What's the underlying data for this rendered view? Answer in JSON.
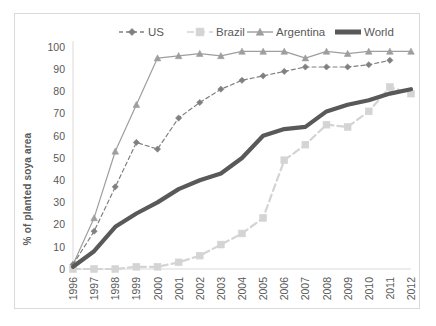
{
  "chart_data": {
    "type": "line",
    "title": "",
    "xlabel": "",
    "ylabel": "% of planted soya area",
    "x": [
      1996,
      1997,
      1998,
      1999,
      2000,
      2001,
      2002,
      2003,
      2004,
      2005,
      2006,
      2007,
      2008,
      2009,
      2010,
      2011,
      2012
    ],
    "categories": [
      "1996",
      "1997",
      "1998",
      "1999",
      "2000",
      "2001",
      "2002",
      "2003",
      "2004",
      "2005",
      "2006",
      "2007",
      "2008",
      "2009",
      "2010",
      "2011",
      "2012"
    ],
    "xlim": [
      1996,
      2012
    ],
    "ylim": [
      0,
      100
    ],
    "yticks": [
      0,
      10,
      20,
      30,
      40,
      50,
      60,
      70,
      80,
      90,
      100
    ],
    "ytick_labels": [
      "0",
      "10",
      "20",
      "30",
      "40",
      "50",
      "60",
      "70",
      "80",
      "90",
      "100"
    ],
    "grid": false,
    "legend_position": "top",
    "series": [
      {
        "name": "US",
        "color": "#808080",
        "style": "dashed",
        "marker": "diamond",
        "width": 1.2,
        "values": [
          2,
          17,
          37,
          57,
          54,
          68,
          75,
          81,
          85,
          87,
          89,
          91,
          91,
          91,
          92,
          94,
          null
        ]
      },
      {
        "name": "Brazil",
        "color": "#d4d4d4",
        "style": "dashed",
        "marker": "square",
        "width": 2.2,
        "values": [
          0,
          0,
          0,
          1,
          1,
          3,
          6,
          11,
          16,
          23,
          49,
          56,
          65,
          64,
          71,
          82,
          79
        ]
      },
      {
        "name": "Argentina",
        "color": "#9e9e9e",
        "style": "solid",
        "marker": "triangle",
        "width": 1.2,
        "values": [
          2,
          23,
          53,
          74,
          95,
          96,
          97,
          96,
          98,
          98,
          98,
          95,
          98,
          97,
          98,
          98,
          98
        ]
      },
      {
        "name": "World",
        "color": "#595959",
        "style": "solid",
        "marker": "none",
        "width": 4.2,
        "values": [
          1,
          8,
          19,
          25,
          30,
          36,
          40,
          43,
          50,
          60,
          63,
          64,
          71,
          74,
          76,
          79,
          81
        ]
      }
    ],
    "legend": [
      {
        "label": "US",
        "color": "#808080",
        "style": "dashed",
        "marker": "diamond"
      },
      {
        "label": "Brazil",
        "color": "#d4d4d4",
        "style": "dashed",
        "marker": "square"
      },
      {
        "label": "Argentina",
        "color": "#9e9e9e",
        "style": "solid",
        "marker": "triangle"
      },
      {
        "label": "World",
        "color": "#595959",
        "style": "solid",
        "marker": "none"
      }
    ]
  }
}
